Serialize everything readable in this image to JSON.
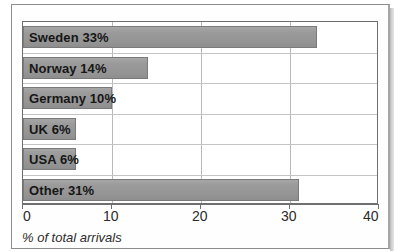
{
  "chart_data": {
    "type": "bar",
    "orientation": "horizontal",
    "title": "",
    "subtitle": "",
    "xlabel": "% of total arrivals",
    "ylabel": "",
    "xlim": [
      0,
      40
    ],
    "xticks": [
      0,
      10,
      20,
      30,
      40
    ],
    "xtick_labels": [
      "0",
      "10",
      "20",
      "30",
      "40"
    ],
    "grid": true,
    "grid_axis": "both",
    "legend": false,
    "legend_position": "none",
    "categories": [
      "Sweden",
      "Norway",
      "Germany",
      "UK",
      "USA",
      "Other"
    ],
    "values": [
      33,
      14,
      10,
      6,
      6,
      31
    ],
    "bar_labels": [
      "Sweden 33%",
      "Norway 14%",
      "Germany 10%",
      "UK 6%",
      "USA 6%",
      "Other 31%"
    ],
    "colors": {
      "bar_fill": "#9a9a9a",
      "bar_edge": "#7a7a7a",
      "label_text": "#161616",
      "axis": "#6f6f6f",
      "grid": "#bfbfbf",
      "background": "#ffffff"
    }
  },
  "axis": {
    "caption": "% of total arrivals",
    "ticks": [
      {
        "value": 0,
        "label": "0"
      },
      {
        "value": 10,
        "label": "10"
      },
      {
        "value": 20,
        "label": "20"
      },
      {
        "value": 30,
        "label": "30"
      },
      {
        "value": 40,
        "label": "40"
      }
    ]
  },
  "bars": [
    {
      "category": "Sweden",
      "value": 33,
      "label": "Sweden 33%"
    },
    {
      "category": "Norway",
      "value": 14,
      "label": "Norway 14%"
    },
    {
      "category": "Germany",
      "value": 10,
      "label": "Germany 10%"
    },
    {
      "category": "UK",
      "value": 6,
      "label": "UK 6%"
    },
    {
      "category": "USA",
      "value": 6,
      "label": "USA 6%"
    },
    {
      "category": "Other",
      "value": 31,
      "label": "Other 31%"
    }
  ]
}
